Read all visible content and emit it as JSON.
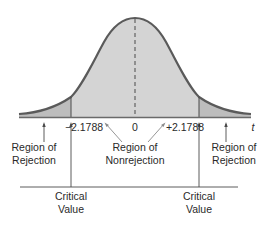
{
  "diagram": {
    "type": "t-distribution two-tailed rejection regions",
    "axis": {
      "variable": "t",
      "ticks": [
        "−2.1788",
        "0",
        "+2.1788"
      ]
    },
    "regions": {
      "left": {
        "line1": "Region of",
        "line2": "Rejection"
      },
      "center": {
        "line1": "Region of",
        "line2": "Nonrejection"
      },
      "right": {
        "line1": "Region of",
        "line2": "Rejection"
      }
    },
    "critical_values": {
      "left": {
        "line1": "Critical",
        "line2": "Value"
      },
      "right": {
        "line1": "Critical",
        "line2": "Value"
      }
    },
    "colors": {
      "curve": "#5a5a5a",
      "fill_nonrejection": "#d4d4d4",
      "fill_rejection": "#bdbdbd",
      "axis": "#6a6a6a",
      "text": "#2a2a2a"
    }
  }
}
